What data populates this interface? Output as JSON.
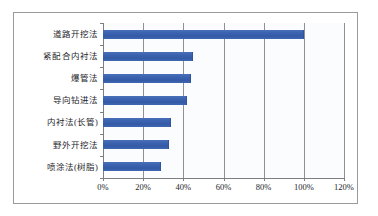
{
  "chart_data": {
    "type": "bar",
    "orientation": "horizontal",
    "title": "",
    "subtitle": "",
    "xlabel": "",
    "ylabel": "",
    "categories": [
      "道路开挖法",
      "紧配合内衬法",
      "爆管法",
      "导向钻进法",
      "内衬法(长管)",
      "野外开挖法",
      "喷涂法(树脂)"
    ],
    "values": [
      100,
      45,
      44,
      42,
      34,
      33,
      29
    ],
    "value_suffix": "%",
    "xlim": [
      0,
      120
    ],
    "xticks": [
      0,
      20,
      40,
      60,
      80,
      100,
      120
    ],
    "xtick_labels": [
      "0%",
      "20%",
      "40%",
      "60%",
      "80%",
      "100%",
      "120%"
    ],
    "grid": "vertical",
    "legend": "none",
    "series": [
      {
        "name": "",
        "values": [
          100,
          45,
          44,
          42,
          34,
          33,
          29
        ]
      }
    ]
  },
  "colors": {
    "bar": "#3f66b0",
    "bar_edge": "#2f539c",
    "gridline": "#8f9094",
    "axis": "#7d7e82",
    "frame_border": "#9a9a9a",
    "plot_background": "#fbfcfe",
    "page_background": "#ffffff",
    "text": "#25262b"
  }
}
